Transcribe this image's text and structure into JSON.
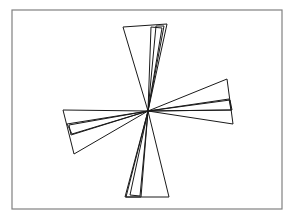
{
  "diagram": {
    "type": "radial-triangles",
    "frame": {
      "x": 12,
      "y": 10,
      "width": 270,
      "height": 199,
      "stroke": "#808080"
    },
    "center": {
      "x": 148,
      "y": 111
    },
    "stroke": "#1a1a1a",
    "triangles": [
      {
        "name": "triangle-up-wide",
        "points": [
          [
            148,
            111
          ],
          [
            123,
            27
          ],
          [
            167,
            24
          ]
        ]
      },
      {
        "name": "triangle-up-inner",
        "points": [
          [
            148,
            111
          ],
          [
            151,
            27
          ],
          [
            162,
            28
          ]
        ]
      },
      {
        "name": "triangle-up-mid",
        "points": [
          [
            148,
            111
          ],
          [
            156,
            26
          ],
          [
            164,
            26
          ]
        ]
      },
      {
        "name": "triangle-down-wide",
        "points": [
          [
            148,
            111
          ],
          [
            125,
            197
          ],
          [
            169,
            197
          ]
        ]
      },
      {
        "name": "triangle-down-inner-1",
        "points": [
          [
            148,
            111
          ],
          [
            130,
            195
          ],
          [
            140,
            196
          ]
        ]
      },
      {
        "name": "triangle-down-inner-2",
        "points": [
          [
            148,
            111
          ],
          [
            126,
            197
          ],
          [
            141,
            197
          ]
        ]
      },
      {
        "name": "triangle-left-wide",
        "points": [
          [
            148,
            111
          ],
          [
            63,
            110
          ],
          [
            74,
            154
          ]
        ]
      },
      {
        "name": "triangle-left-inner-1",
        "points": [
          [
            148,
            111
          ],
          [
            67,
            124
          ],
          [
            72,
            134
          ]
        ]
      },
      {
        "name": "triangle-left-inner-2",
        "points": [
          [
            148,
            111
          ],
          [
            69,
            125
          ],
          [
            71,
            135
          ]
        ]
      },
      {
        "name": "triangle-right-wide",
        "points": [
          [
            148,
            111
          ],
          [
            227,
            79
          ],
          [
            233,
            124
          ]
        ]
      },
      {
        "name": "triangle-right-inner-1",
        "points": [
          [
            148,
            111
          ],
          [
            229,
            99
          ],
          [
            231,
            110
          ]
        ]
      },
      {
        "name": "triangle-right-inner-2",
        "points": [
          [
            148,
            111
          ],
          [
            230,
            100
          ],
          [
            232,
            110
          ]
        ]
      }
    ]
  }
}
